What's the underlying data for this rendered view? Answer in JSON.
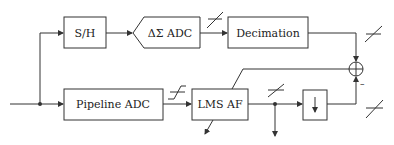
{
  "diagram": {
    "title": "",
    "blocks": [
      {
        "id": "sh",
        "label": "S/H"
      },
      {
        "id": "dsadc",
        "label": "ΔΣ ADC"
      },
      {
        "id": "decimation",
        "label": "Decimation"
      },
      {
        "id": "pipeline",
        "label": "Pipeline ADC"
      },
      {
        "id": "lms",
        "label": "LMS AF"
      },
      {
        "id": "downsample",
        "label": "↓"
      }
    ],
    "summing_junction": {
      "minus_sign": "–"
    },
    "colors": {
      "line": "#333333",
      "background": "#ffffff"
    }
  }
}
